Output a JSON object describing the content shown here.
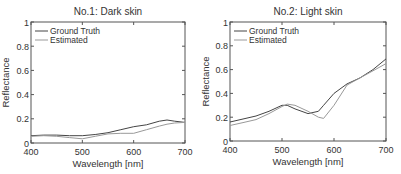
{
  "chart_data": [
    {
      "type": "line",
      "title": "No.1: Dark skin",
      "xlabel": "Wavelength [nm]",
      "ylabel": "Reflectance",
      "xlim": [
        400,
        700
      ],
      "ylim": [
        0,
        1
      ],
      "xticks": [
        400,
        500,
        600,
        700
      ],
      "yticks": [
        0,
        0.2,
        0.4,
        0.6,
        0.8,
        1
      ],
      "ytick_labels": [
        "0",
        "0.2",
        "0.4",
        "0.6",
        "0.8",
        "1"
      ],
      "grid": false,
      "legend_position": "upper left",
      "x": [
        400,
        425,
        450,
        475,
        500,
        525,
        550,
        575,
        600,
        625,
        650,
        665,
        680,
        700
      ],
      "series": [
        {
          "name": "Ground Truth",
          "color": "#444444",
          "values": [
            0.06,
            0.065,
            0.065,
            0.06,
            0.06,
            0.07,
            0.085,
            0.11,
            0.135,
            0.15,
            0.18,
            0.19,
            0.18,
            0.17
          ]
        },
        {
          "name": "Estimated",
          "color": "#999999",
          "values": [
            0.055,
            0.06,
            0.055,
            0.045,
            0.035,
            0.055,
            0.075,
            0.08,
            0.08,
            0.11,
            0.14,
            0.155,
            0.165,
            0.17
          ]
        }
      ]
    },
    {
      "type": "line",
      "title": "No.2: Light skin",
      "xlabel": "Wavelength [nm]",
      "ylabel": "Reflectance",
      "xlim": [
        400,
        700
      ],
      "ylim": [
        0,
        1
      ],
      "xticks": [
        400,
        500,
        600,
        700
      ],
      "yticks": [
        0,
        0.2,
        0.4,
        0.6,
        0.8,
        1
      ],
      "ytick_labels": [
        "0",
        "0.2",
        "0.4",
        "0.6",
        "0.8",
        "1"
      ],
      "grid": false,
      "legend_position": "upper left",
      "x": [
        400,
        425,
        450,
        475,
        500,
        510,
        525,
        550,
        570,
        580,
        600,
        625,
        650,
        675,
        700
      ],
      "series": [
        {
          "name": "Ground Truth",
          "color": "#444444",
          "values": [
            0.16,
            0.185,
            0.21,
            0.25,
            0.3,
            0.3,
            0.27,
            0.23,
            0.25,
            0.3,
            0.4,
            0.48,
            0.53,
            0.6,
            0.69
          ]
        },
        {
          "name": "Estimated",
          "color": "#999999",
          "values": [
            0.13,
            0.155,
            0.18,
            0.23,
            0.29,
            0.31,
            0.3,
            0.25,
            0.2,
            0.19,
            0.3,
            0.47,
            0.53,
            0.59,
            0.65
          ]
        }
      ]
    }
  ]
}
